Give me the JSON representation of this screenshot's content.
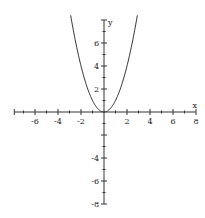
{
  "chart_data": {
    "type": "line",
    "title": "",
    "xlabel": "x",
    "ylabel": "y",
    "xlim": [
      -8,
      8
    ],
    "ylim": [
      -8,
      8
    ],
    "grid": false,
    "x_ticks": [
      -6,
      -4,
      -2,
      2,
      4,
      6,
      8
    ],
    "y_ticks": [
      6,
      4,
      2,
      -4,
      -6,
      -8
    ],
    "series": [
      {
        "name": "y = x^2",
        "x": [
          -2.9,
          -2.5,
          -2,
          -1.5,
          -1,
          -0.5,
          0,
          0.5,
          1,
          1.5,
          2,
          2.5,
          2.9
        ],
        "values": [
          8.41,
          6.25,
          4,
          2.25,
          1,
          0.25,
          0,
          0.25,
          1,
          2.25,
          4,
          6.25,
          8.41
        ]
      }
    ]
  },
  "labels": {
    "x_axis": "x",
    "y_axis": "y",
    "x_tick_labels": [
      "-6",
      "-4",
      "-2",
      "2",
      "4",
      "6",
      "8"
    ],
    "y_tick_labels": [
      "6",
      "4",
      "2",
      "-4",
      "-6",
      "-8"
    ]
  }
}
